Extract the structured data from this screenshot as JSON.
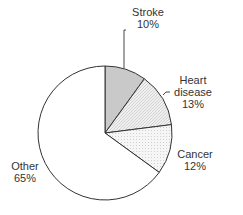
{
  "chart_data": {
    "type": "pie",
    "title": "",
    "categories": [
      "Stroke",
      "Heart disease",
      "Cancer",
      "Other"
    ],
    "values": [
      10,
      13,
      12,
      65
    ],
    "labels": [
      "Stroke\n10%",
      "Heart disease 13%",
      "Cancer 12%",
      "Other 65%"
    ],
    "start_angle": "12 o'clock, clockwise",
    "fills": {
      "Stroke": "#c8c8c8",
      "Heart disease": "#e4e4e4 (hatched)",
      "Cancer": "#ececec (dotted)",
      "Other": "#ffffff"
    }
  },
  "labels": {
    "stroke": {
      "name": "Stroke",
      "pct": "10%"
    },
    "heart": {
      "name1": "Heart",
      "name2": "disease",
      "pct": "13%"
    },
    "cancer": {
      "name": "Cancer",
      "pct": "12%"
    },
    "other": {
      "name": "Other",
      "pct": "65%"
    }
  }
}
